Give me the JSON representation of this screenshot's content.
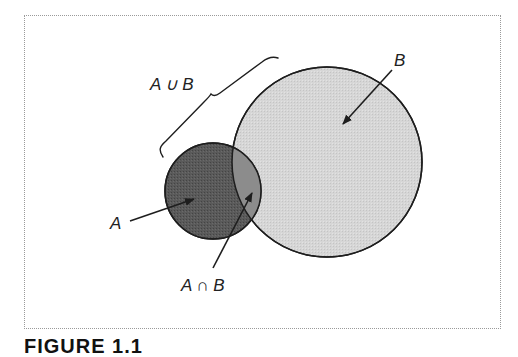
{
  "figure": {
    "caption": "FIGURE 1.1",
    "colors": {
      "set_a_fill": "#5a5a5a",
      "set_b_fill": "#d6d6d6",
      "intersection_fill": "#8c8c8c",
      "stroke": "#1e1e1e",
      "frame_border": "#9a9a9a"
    },
    "sets": [
      {
        "id": "A",
        "label": "A",
        "cx": 213,
        "cy": 191,
        "r": 48
      },
      {
        "id": "B",
        "label": "B",
        "cx": 327,
        "cy": 162,
        "r": 95
      }
    ],
    "annotations": {
      "union_label": "A ∪ B",
      "intersection_label": "A ∩ B",
      "set_a_label": "A",
      "set_b_label": "B"
    }
  }
}
